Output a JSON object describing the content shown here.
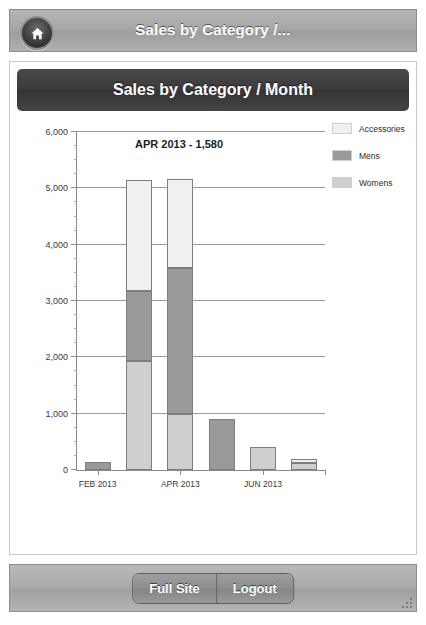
{
  "header": {
    "title": "Sales by Category /...",
    "home_icon": "home-icon"
  },
  "panel": {
    "chart_title": "Sales by Category / Month"
  },
  "footer": {
    "full_site_label": "Full Site",
    "logout_label": "Logout",
    "grip_icon": "resize-grip-icon"
  },
  "colors": {
    "accessories": "#f0f0f0",
    "mens": "#9a9a9a",
    "womens": "#cfcfcf",
    "axis": "#8a8a8a",
    "grid": "#9a9a9a",
    "title_bar": "#3a3a3a",
    "chrome": "#a7a7a7"
  },
  "chart_data": {
    "type": "bar",
    "title": "Sales by Category / Month",
    "stacked": true,
    "xlabel": "",
    "ylabel": "",
    "ylim": [
      0,
      6000
    ],
    "yticks": [
      0,
      1000,
      2000,
      3000,
      4000,
      5000,
      6000
    ],
    "ytick_labels": [
      "0",
      "1,000",
      "2,000",
      "3,000",
      "4,000",
      "5,000",
      "6,000"
    ],
    "grid": true,
    "legend_position": "right",
    "categories": [
      "FEB 2013",
      "MAR 2013",
      "APR 2013",
      "MAY 2013",
      "JUN 2013",
      "JUL 2013"
    ],
    "xtick_labels": [
      "FEB 2013",
      "APR 2013",
      "JUN 2013"
    ],
    "series": [
      {
        "name": "Womens",
        "values": [
          0,
          1930,
          1000,
          0,
          400,
          130
        ]
      },
      {
        "name": "Mens",
        "values": [
          150,
          1250,
          2580,
          900,
          0,
          0
        ]
      },
      {
        "name": "Accessories",
        "values": [
          0,
          1970,
          1580,
          0,
          0,
          70
        ]
      }
    ],
    "totals": [
      150,
      5150,
      5160,
      900,
      400,
      200
    ],
    "annotation": "APR 2013 - 1,580",
    "legend": [
      "Accessories",
      "Mens",
      "Womens"
    ]
  }
}
